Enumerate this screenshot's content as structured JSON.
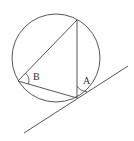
{
  "diagram": {
    "type": "circle-inscribed-triangle-tangent",
    "colors": {
      "stroke": "#444444",
      "background": "#ffffff"
    },
    "circle": {
      "cx": 56,
      "cy": 58,
      "r": 44
    },
    "vertices": {
      "top": {
        "x": 77,
        "y": 20
      },
      "left": {
        "x": 18,
        "y": 81
      },
      "bottom": {
        "x": 77,
        "y": 98
      }
    },
    "tangent_line": {
      "x1": 24,
      "y1": 133,
      "x2": 128,
      "y2": 66
    },
    "angles": [
      {
        "label": "B",
        "vertex": "left"
      },
      {
        "label": "A",
        "vertex": "bottom"
      }
    ]
  }
}
